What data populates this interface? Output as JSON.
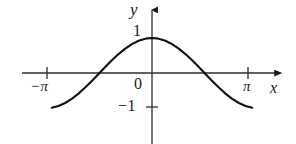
{
  "figure": {
    "background_color": "#ffffff",
    "ink_color": "#1a1a1a"
  },
  "axes": {
    "y_axis_label": "y",
    "x_axis_label": "x",
    "origin_label": "0"
  },
  "ticks": {
    "y_positive_one": "1",
    "y_negative_one": "−1",
    "x_negative_pi": "−π",
    "x_positive_pi": "π"
  },
  "chart_data": {
    "type": "line",
    "title": "",
    "xlabel": "x",
    "ylabel": "y",
    "xlim": [
      -3.6,
      4.0
    ],
    "ylim": [
      -1.9,
      2.0
    ],
    "grid": false,
    "legend": null,
    "xticks": [
      -3.14159,
      0,
      3.14159
    ],
    "xticklabels": [
      "−π",
      "0",
      "π"
    ],
    "yticks": [
      -1,
      1
    ],
    "yticklabels": [
      "−1",
      "1"
    ],
    "series": [
      {
        "name": "y = cos(x)",
        "equation": "y = cos(x)",
        "x": [
          -3.0,
          -2.8,
          -2.6,
          -2.4,
          -2.2,
          -2.0,
          -1.8,
          -1.6,
          -1.4,
          -1.2,
          -1.0,
          -0.8,
          -0.6,
          -0.4,
          -0.2,
          0.0,
          0.2,
          0.4,
          0.6,
          0.8,
          1.0,
          1.2,
          1.4,
          1.6,
          1.8,
          2.0,
          2.2,
          2.4,
          2.6,
          2.8,
          3.0
        ],
        "y": [
          -0.99,
          -0.942,
          -0.857,
          -0.737,
          -0.589,
          -0.416,
          -0.227,
          -0.029,
          0.17,
          0.362,
          0.54,
          0.697,
          0.825,
          0.921,
          0.98,
          1.0,
          0.98,
          0.921,
          0.825,
          0.697,
          0.54,
          0.362,
          0.17,
          -0.029,
          -0.227,
          -0.416,
          -0.589,
          -0.737,
          -0.857,
          -0.942,
          -0.99
        ]
      }
    ],
    "annotations": [
      {
        "text": "−π",
        "x": -3.14159,
        "y": 0
      },
      {
        "text": "π",
        "x": 3.14159,
        "y": 0
      },
      {
        "text": "0",
        "x": 0,
        "y": 0
      },
      {
        "text": "1",
        "x": 0,
        "y": 1
      },
      {
        "text": "−1",
        "x": 0,
        "y": -1
      }
    ]
  }
}
